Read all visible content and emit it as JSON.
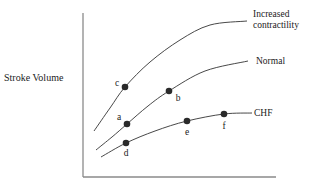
{
  "chart_data": {
    "type": "line",
    "title": "",
    "xlabel": "",
    "ylabel": "Stroke Volume",
    "grid": false,
    "legend_position": "inline-right",
    "axes": {
      "origin": [
        83,
        177
      ],
      "x_end": [
        276,
        177
      ],
      "y_end": [
        83,
        13
      ],
      "color": "#8a8a8a"
    },
    "series": [
      {
        "name": "Increased contractility",
        "label_lines": [
          "Increased",
          "contractility"
        ],
        "color": "#333333",
        "path": [
          [
            94,
            131
          ],
          [
            110,
            108
          ],
          [
            125,
            87
          ],
          [
            150,
            62
          ],
          [
            180,
            40
          ],
          [
            210,
            25
          ],
          [
            247,
            21
          ]
        ],
        "label_pos": [
          253,
          17
        ],
        "points": [
          {
            "label": "c",
            "x": 125,
            "y": 87,
            "label_dx": -8,
            "label_dy": -1
          }
        ]
      },
      {
        "name": "Normal",
        "label_lines": [
          "Normal"
        ],
        "color": "#333333",
        "path": [
          [
            96,
            150
          ],
          [
            112,
            137
          ],
          [
            127,
            124
          ],
          [
            148,
            106
          ],
          [
            169,
            91
          ],
          [
            205,
            71
          ],
          [
            248,
            61
          ]
        ],
        "label_pos": [
          256,
          64
        ],
        "points": [
          {
            "label": "a",
            "x": 127,
            "y": 124,
            "label_dx": -8,
            "label_dy": -4
          },
          {
            "label": "b",
            "x": 169,
            "y": 91,
            "label_dx": 9,
            "label_dy": 10
          }
        ]
      },
      {
        "name": "CHF",
        "label_lines": [
          "CHF"
        ],
        "color": "#333333",
        "path": [
          [
            101,
            157
          ],
          [
            126,
            143
          ],
          [
            155,
            131
          ],
          [
            187,
            121
          ],
          [
            224,
            114
          ],
          [
            252,
            113
          ]
        ],
        "label_pos": [
          254,
          116
        ],
        "points": [
          {
            "label": "d",
            "x": 126,
            "y": 143,
            "label_dx": 0,
            "label_dy": 13
          },
          {
            "label": "e",
            "x": 187,
            "y": 121,
            "label_dx": 0,
            "label_dy": 14
          },
          {
            "label": "f",
            "x": 224,
            "y": 114,
            "label_dx": 0,
            "label_dy": 15
          }
        ]
      }
    ],
    "ylabel_pos": [
      4,
      81
    ]
  }
}
